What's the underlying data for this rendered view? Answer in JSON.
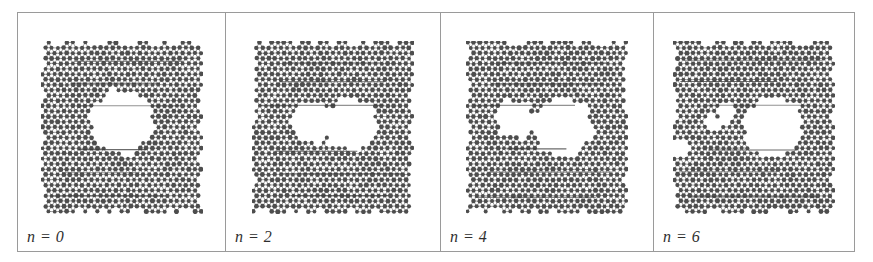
{
  "figure": {
    "kind": "molecular-lattice-simulation-strip",
    "panel_count": 4,
    "frame_color": "#9a9a9a",
    "background_color": "#ffffff",
    "atom_color": "#4d4d4d",
    "bond_color": "#8c8c8c",
    "void_color": "#ffffff"
  },
  "panels": [
    {
      "label": "n = 0",
      "description": "Triangular atomic lattice with a single hexagonal void at the center",
      "void_count": 1,
      "voids": [
        {
          "cx": 0.5,
          "cy": 0.47,
          "r": 0.2,
          "shape": "hexagon"
        }
      ]
    },
    {
      "label": "n = 2",
      "description": "Central void split into two lobes separated by a narrow atomic bridge",
      "void_count": 2,
      "voids": [
        {
          "cx": 0.36,
          "cy": 0.47,
          "r": 0.13,
          "shape": "rounded"
        },
        {
          "cx": 0.61,
          "cy": 0.48,
          "r": 0.17,
          "shape": "hexagon"
        }
      ]
    },
    {
      "label": "n = 4",
      "description": "Left lobe smaller, right void enlarged, disordered bridging region between",
      "void_count": 2,
      "voids": [
        {
          "cx": 0.3,
          "cy": 0.45,
          "r": 0.12,
          "shape": "rounded"
        },
        {
          "cx": 0.6,
          "cy": 0.5,
          "r": 0.19,
          "shape": "hexagon"
        }
      ]
    },
    {
      "label": "n = 6",
      "description": "Single large void on the right with small satellite voids and an edge notch on the left",
      "void_count": 4,
      "voids": [
        {
          "cx": 0.62,
          "cy": 0.5,
          "r": 0.19,
          "shape": "hexagon"
        },
        {
          "cx": 0.33,
          "cy": 0.42,
          "r": 0.055,
          "shape": "round"
        },
        {
          "cx": 0.25,
          "cy": 0.48,
          "r": 0.05,
          "shape": "round"
        },
        {
          "cx": 0.04,
          "cy": 0.62,
          "r": 0.05,
          "shape": "round"
        }
      ]
    }
  ]
}
